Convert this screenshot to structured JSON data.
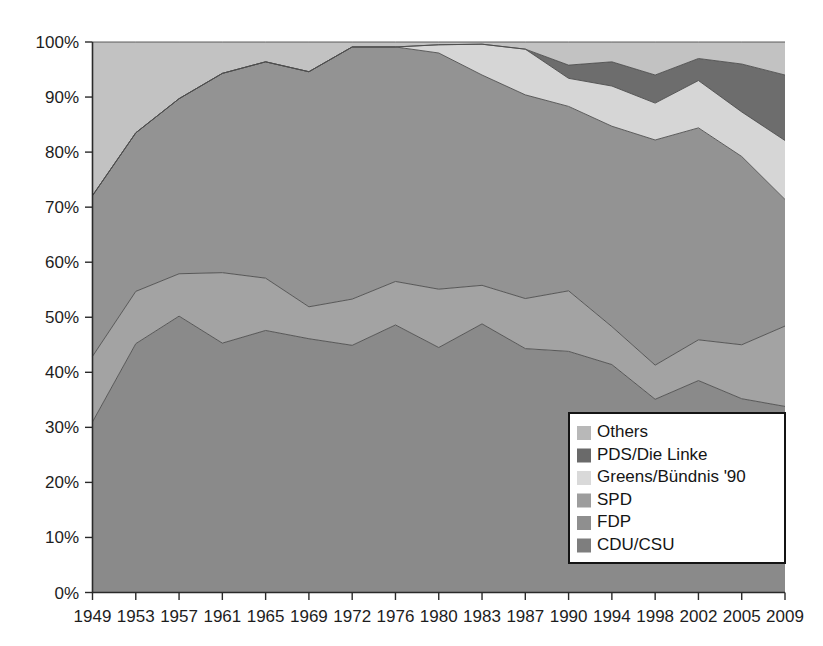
{
  "chart_data": {
    "type": "area",
    "stacked": true,
    "title": "",
    "subtitle": "",
    "xlabel": "",
    "ylabel": "",
    "grid": false,
    "legend_position": "bottom-right",
    "ylim": [
      0,
      100
    ],
    "ytick_labels": [
      "0%",
      "10%",
      "20%",
      "30%",
      "40%",
      "50%",
      "60%",
      "70%",
      "80%",
      "90%",
      "100%"
    ],
    "ytick_values": [
      0,
      10,
      20,
      30,
      40,
      50,
      60,
      70,
      80,
      90,
      100
    ],
    "categories": [
      "1949",
      "1953",
      "1957",
      "1961",
      "1965",
      "1969",
      "1972",
      "1976",
      "1980",
      "1983",
      "1987",
      "1990",
      "1994",
      "1998",
      "2002",
      "2005",
      "2009"
    ],
    "x": [
      1949,
      1953,
      1957,
      1961,
      1965,
      1969,
      1972,
      1976,
      1980,
      1983,
      1987,
      1990,
      1994,
      1998,
      2002,
      2005,
      2009
    ],
    "stack_order_bottom_to_top": [
      "CDU/CSU",
      "FDP",
      "SPD",
      "Greens/Bündnis '90",
      "PDS/Die Linke",
      "Others"
    ],
    "series": [
      {
        "name": "CDU/CSU",
        "color": "#8a8a8a",
        "values": [
          31.0,
          45.2,
          50.2,
          45.3,
          47.6,
          46.1,
          44.9,
          48.6,
          44.5,
          48.8,
          44.3,
          43.8,
          41.4,
          35.1,
          38.5,
          35.2,
          33.8
        ]
      },
      {
        "name": "FDP",
        "color": "#a3a3a3",
        "values": [
          11.9,
          9.5,
          7.7,
          12.8,
          9.5,
          5.8,
          8.4,
          7.9,
          10.6,
          7.0,
          9.1,
          11.0,
          6.9,
          6.2,
          7.4,
          9.8,
          14.6
        ]
      },
      {
        "name": "SPD",
        "color": "#939393",
        "values": [
          29.2,
          28.8,
          31.8,
          36.2,
          39.3,
          42.7,
          45.8,
          42.6,
          42.9,
          38.2,
          37.0,
          33.5,
          36.4,
          40.9,
          38.5,
          34.2,
          23.0
        ]
      },
      {
        "name": "Greens/Bündnis '90",
        "color": "#d6d6d6",
        "values": [
          0.0,
          0.0,
          0.0,
          0.0,
          0.0,
          0.0,
          0.0,
          0.0,
          1.5,
          5.6,
          8.3,
          5.1,
          7.3,
          6.7,
          8.6,
          8.1,
          10.7
        ]
      },
      {
        "name": "PDS/Die Linke",
        "color": "#6d6d6d",
        "values": [
          0.0,
          0.0,
          0.0,
          0.0,
          0.0,
          0.0,
          0.0,
          0.0,
          0.0,
          0.0,
          0.0,
          2.4,
          4.4,
          5.1,
          4.0,
          8.7,
          11.9
        ]
      },
      {
        "name": "Others",
        "color": "#c2c2c2",
        "values": [
          27.9,
          16.5,
          10.3,
          5.7,
          3.6,
          5.4,
          0.9,
          0.9,
          0.5,
          0.4,
          1.3,
          4.2,
          3.6,
          6.0,
          3.0,
          4.0,
          6.0
        ]
      }
    ]
  },
  "legend": {
    "entries": [
      {
        "label": "Others",
        "color": "#b8b8b8"
      },
      {
        "label": "PDS/Die Linke",
        "color": "#6a6a6a"
      },
      {
        "label": "Greens/Bündnis '90",
        "color": "#d9d9d9"
      },
      {
        "label": "SPD",
        "color": "#9d9d9d"
      },
      {
        "label": "FDP",
        "color": "#8f8f8f"
      },
      {
        "label": "CDU/CSU",
        "color": "#7e7e7e"
      }
    ]
  }
}
